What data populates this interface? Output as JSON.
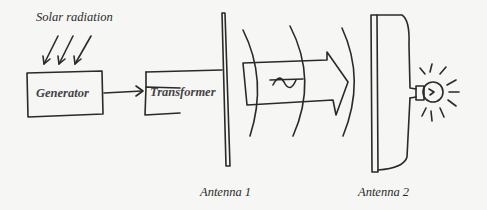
{
  "diagram": {
    "labels": {
      "solar_radiation": "Solar radiation",
      "generator": "Generator",
      "transformer": "Transformer",
      "antenna1": "Antenna 1",
      "antenna2": "Antenna 2"
    },
    "symbols": {
      "beam_symbol": "$"
    },
    "colors": {
      "ink": "#2a2a2a",
      "paper": "#f6f6f4"
    }
  }
}
